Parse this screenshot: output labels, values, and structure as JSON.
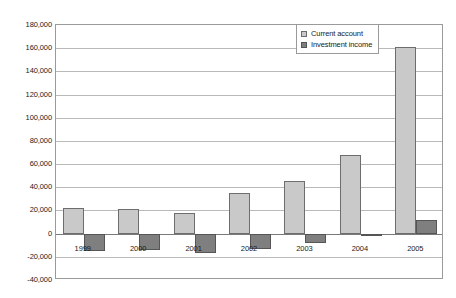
{
  "chart_data": {
    "type": "bar",
    "title": "",
    "subtitle": "",
    "xlabel": "",
    "ylabel": "",
    "categories": [
      "1999",
      "2000",
      "2001",
      "2002",
      "2003",
      "2004",
      "2005"
    ],
    "series": [
      {
        "name": "Current account",
        "color": "#c9c9c9",
        "values": [
          22000,
          21000,
          18000,
          35000,
          45000,
          68000,
          161000
        ]
      },
      {
        "name": "Investment income",
        "color": "#7f7f7f",
        "values": [
          -15000,
          -14000,
          -17000,
          -13000,
          -8000,
          -2000,
          12000
        ]
      }
    ],
    "ylim": [
      -40000,
      180000
    ],
    "ytick_values": [
      180000,
      160000,
      140000,
      120000,
      100000,
      80000,
      60000,
      40000,
      20000,
      0,
      -20000,
      -40000
    ],
    "ytick_labels": [
      "180,000",
      "160,000",
      "140,000",
      "120,000",
      "100,000",
      "80,000",
      "60,000",
      "40,000",
      "20,000",
      "0",
      "-20,000",
      "-40,000"
    ],
    "grid": true,
    "legend_position": "top-right",
    "legend_entries": [
      "Current account",
      "Investment income"
    ]
  }
}
